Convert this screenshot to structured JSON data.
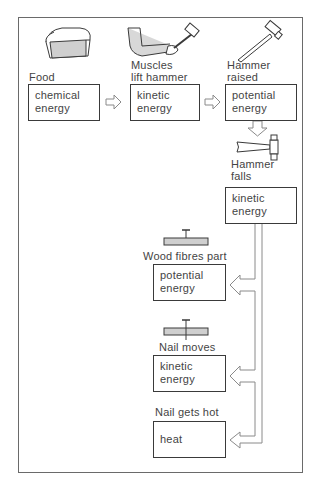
{
  "diagram": {
    "stages": [
      {
        "caption": "Food",
        "energy": "chemical\nenergy",
        "illustration": "bread-loaf-icon"
      },
      {
        "caption": "Muscles\nlift hammer",
        "energy": "kinetic\nenergy",
        "illustration": "arm-lifting-hammer-icon"
      },
      {
        "caption": "Hammer\nraised",
        "energy": "potential\nenergy",
        "illustration": "raised-hammer-icon"
      },
      {
        "caption": "Hammer\nfalls",
        "energy": "kinetic\nenergy",
        "illustration": "falling-hammer-icon"
      },
      {
        "caption": "Wood fibres part",
        "energy": "potential\nenergy",
        "illustration": "nail-on-wood-icon"
      },
      {
        "caption": "Nail moves",
        "energy": "kinetic\nenergy",
        "illustration": "nail-in-wood-icon"
      },
      {
        "caption": "Nail gets hot",
        "energy": "heat",
        "illustration": null
      }
    ],
    "colors": {
      "line": "#3a3a3a",
      "frame": "#6a6a6a",
      "arrow_outline": "#8a8a8a",
      "shading": "#cfcfcf"
    }
  }
}
